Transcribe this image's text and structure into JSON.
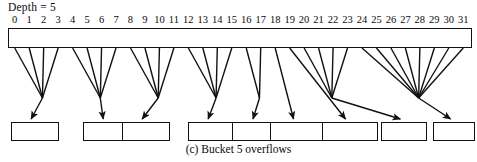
{
  "figure": {
    "depth_label": "Depth = 5",
    "caption": "(c) Bucket 5 overflows",
    "ink_color": "#111111",
    "background": "#ffffff"
  },
  "directory": {
    "size": 32,
    "indices": [
      "0",
      "1",
      "2",
      "3",
      "4",
      "5",
      "6",
      "7",
      "8",
      "9",
      "10",
      "11",
      "12",
      "13",
      "14",
      "15",
      "16",
      "17",
      "18",
      "19",
      "20",
      "21",
      "22",
      "23",
      "24",
      "25",
      "26",
      "27",
      "28",
      "29",
      "30",
      "31"
    ]
  },
  "buckets": [
    {
      "number": "1",
      "label": "000 ...",
      "from_cells": [
        0,
        1,
        2,
        3
      ]
    },
    {
      "number": "2",
      "label": "001 ...",
      "from_cells": [
        4,
        5,
        6,
        7
      ]
    },
    {
      "number": "8",
      "label": "010 ...",
      "from_cells": [
        8,
        9,
        10,
        11
      ]
    },
    {
      "number": "9",
      "label": "011 ...",
      "from_cells": [
        12,
        13,
        14,
        15
      ]
    },
    {
      "number": "4",
      "label": "1000 ...",
      "from_cells": [
        16,
        17
      ]
    },
    {
      "number": "10",
      "label": "10010 ...",
      "from_cells": [
        18
      ]
    },
    {
      "number": "11",
      "label": "10011 ...",
      "from_cells": [
        19
      ]
    },
    {
      "number": "6",
      "label": "101 ...",
      "from_cells": [
        20,
        21,
        22,
        23
      ]
    },
    {
      "number": "7",
      "label": "11 ...",
      "from_cells": [
        24,
        25,
        26,
        27,
        28,
        29,
        30,
        31
      ]
    }
  ]
}
